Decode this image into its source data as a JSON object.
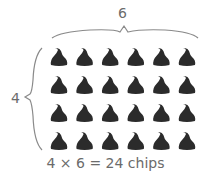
{
  "diagram": {
    "columns_label": "6",
    "rows_label": "4",
    "equation": "4 × 6 = 24 chips",
    "rows": 4,
    "columns": 6,
    "item": "chocolate chip",
    "colors": {
      "chip": "#2b2b2b",
      "brace": "#8a8a8a",
      "text": "#6b6b6b"
    }
  }
}
